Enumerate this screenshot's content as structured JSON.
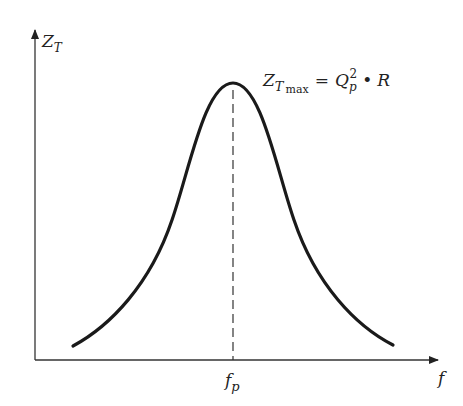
{
  "diagram": {
    "y_axis": {
      "label": "Z",
      "label_sub": "T"
    },
    "x_axis": {
      "label": "f"
    },
    "peak_marker": {
      "label": "f",
      "label_sub": "p"
    },
    "formula": {
      "lhs": "Z",
      "lhs_sub_italic": "T",
      "lhs_sub_roman": "max",
      "eq": "=",
      "q": "Q",
      "q_sub": "p",
      "q_sup": "2",
      "dot": "•",
      "r": "R"
    },
    "colors": {
      "ink": "#222222",
      "background": "#ffffff"
    }
  }
}
